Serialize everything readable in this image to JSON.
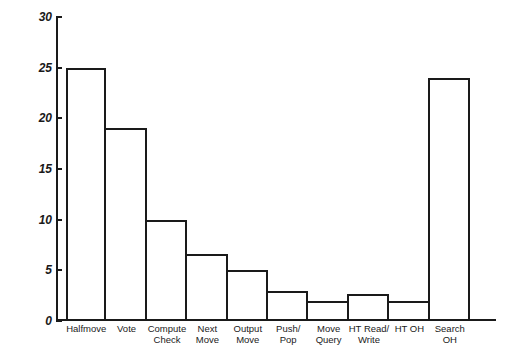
{
  "chart_data": {
    "type": "bar",
    "title": "",
    "xlabel": "",
    "ylabel": "Percent of Total Time",
    "ylim": [
      0,
      30
    ],
    "yticks": [
      0,
      5,
      10,
      15,
      20,
      25,
      30
    ],
    "grid": false,
    "legend": "none",
    "categories": [
      "Halfmove",
      "Vote",
      "Compute\nCheck",
      "Next\nMove",
      "Output\nMove",
      "Push/\nPop",
      "Move\nQuery",
      "HT Read/\nWrite",
      "HT OH",
      "Search\nOH"
    ],
    "values": [
      25,
      19,
      10,
      6.6,
      5,
      3,
      2,
      2.7,
      2,
      24
    ],
    "bar_style": {
      "fill": "#ffffff",
      "edge": "#1a1a1a",
      "edge_width": 2
    }
  },
  "axis": {
    "y_title": "Percent of Total Time",
    "tick_labels": [
      "0",
      "5",
      "10",
      "15",
      "20",
      "25",
      "30"
    ]
  }
}
